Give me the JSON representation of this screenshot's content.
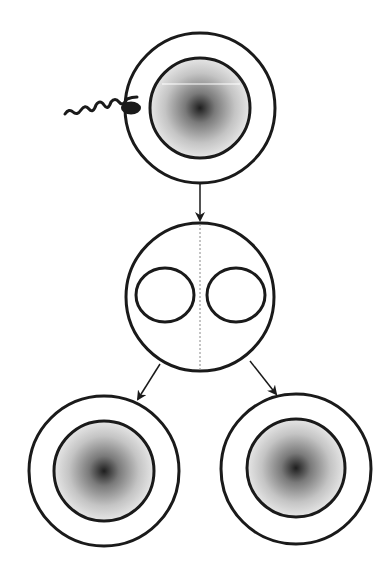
{
  "diagram": {
    "title": "",
    "colors": {
      "stroke": "#1a1a1a",
      "background": "#ffffff",
      "gradient_center": "#1e1e1e",
      "gradient_edge": "#e6e6e6"
    },
    "nodes": [
      {
        "id": "zygote",
        "label": "",
        "kind": "egg-with-sperm"
      },
      {
        "id": "dividing-cell",
        "label": "",
        "kind": "two-nuclei-cell"
      },
      {
        "id": "daughter-left",
        "label": "",
        "kind": "cell"
      },
      {
        "id": "daughter-right",
        "label": "",
        "kind": "cell"
      }
    ],
    "edges": [
      {
        "from": "zygote",
        "to": "dividing-cell"
      },
      {
        "from": "dividing-cell",
        "to": "daughter-left"
      },
      {
        "from": "dividing-cell",
        "to": "daughter-right"
      }
    ]
  }
}
